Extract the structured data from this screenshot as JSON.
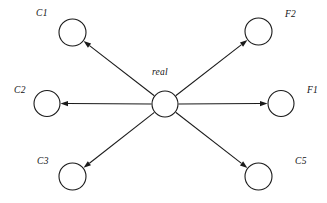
{
  "diagram": {
    "type": "star-graph",
    "background_color": "#ffffff",
    "stroke_color": "#1a1a1a",
    "center_node": {
      "id": "real",
      "label": "real",
      "cx": 165,
      "cy": 104,
      "r": 13,
      "label_x": 152,
      "label_y": 68
    },
    "nodes": [
      {
        "id": "C1",
        "label": "C1",
        "cx": 72.5,
        "cy": 32.5,
        "r": 13.5,
        "label_x": 36,
        "label_y": 9
      },
      {
        "id": "F2",
        "label": "F2",
        "cx": 258.5,
        "cy": 31.5,
        "r": 13.5,
        "label_x": 285,
        "label_y": 10
      },
      {
        "id": "C2",
        "label": "C2",
        "cx": 47,
        "cy": 103.5,
        "r": 13,
        "label_x": 14,
        "label_y": 86
      },
      {
        "id": "F1",
        "label": "F1",
        "cx": 281,
        "cy": 103.5,
        "r": 13,
        "label_x": 307,
        "label_y": 86
      },
      {
        "id": "C3",
        "label": "C3",
        "cx": 72.5,
        "cy": 176.5,
        "r": 13.5,
        "label_x": 37,
        "label_y": 157
      },
      {
        "id": "C5",
        "label": "C5",
        "cx": 258.5,
        "cy": 176.5,
        "r": 13.5,
        "label_x": 295,
        "label_y": 157
      }
    ],
    "edges": [
      {
        "id": "real-to-C1",
        "from": "real",
        "to": "C1",
        "directed": true
      },
      {
        "id": "real-to-F2",
        "from": "real",
        "to": "F2",
        "directed": true
      },
      {
        "id": "real-to-C2",
        "from": "real",
        "to": "C2",
        "directed": true
      },
      {
        "id": "real-to-F1",
        "from": "real",
        "to": "F1",
        "directed": true
      },
      {
        "id": "real-to-C3",
        "from": "real",
        "to": "C3",
        "directed": true
      },
      {
        "id": "real-to-C5",
        "from": "real",
        "to": "C5",
        "directed": true
      }
    ]
  }
}
